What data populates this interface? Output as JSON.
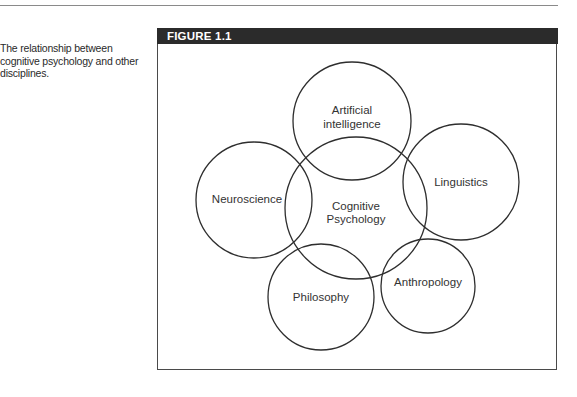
{
  "caption": {
    "lines": [
      "The relationship between",
      "cognitive psychology and other",
      "disciplines."
    ]
  },
  "figure": {
    "title": "FIGURE 1.1",
    "center_circle": {
      "lines": [
        "Cognitive",
        "Psychology"
      ],
      "cx": 356,
      "cy": 208,
      "r": 71
    },
    "circles": [
      {
        "id": "artificial-intelligence",
        "lines": [
          "Artificial",
          "intelligence"
        ],
        "cx": 352,
        "cy": 121,
        "r": 59
      },
      {
        "id": "linguistics",
        "lines": [
          "Linguistics"
        ],
        "cx": 461,
        "cy": 182,
        "r": 58
      },
      {
        "id": "anthropology",
        "lines": [
          "Anthropology"
        ],
        "cx": 428,
        "cy": 286,
        "r": 47
      },
      {
        "id": "philosophy",
        "lines": [
          "Philosophy"
        ],
        "cx": 321,
        "cy": 297,
        "r": 53
      },
      {
        "id": "neuroscience",
        "lines": [
          "Neuroscience"
        ],
        "cx": 254,
        "cy": 200,
        "r": 58
      }
    ]
  },
  "colors": {
    "header_bg": "#2b2b2b",
    "stroke": "#2e2e2e",
    "rule": "#8a8a8a"
  }
}
